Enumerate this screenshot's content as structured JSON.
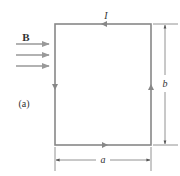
{
  "figure": {
    "panel_label": "(a)",
    "field_label": "B",
    "current_label": "I",
    "width_label": "a",
    "height_label": "b",
    "current_direction": "counter-clockwise",
    "field_direction": "right",
    "field_arrow_count": 3
  },
  "colors": {
    "loop": "#888888",
    "dimension": "#777777",
    "field_arrows": "#999999",
    "text": "#333333",
    "background": "#ffffff"
  }
}
